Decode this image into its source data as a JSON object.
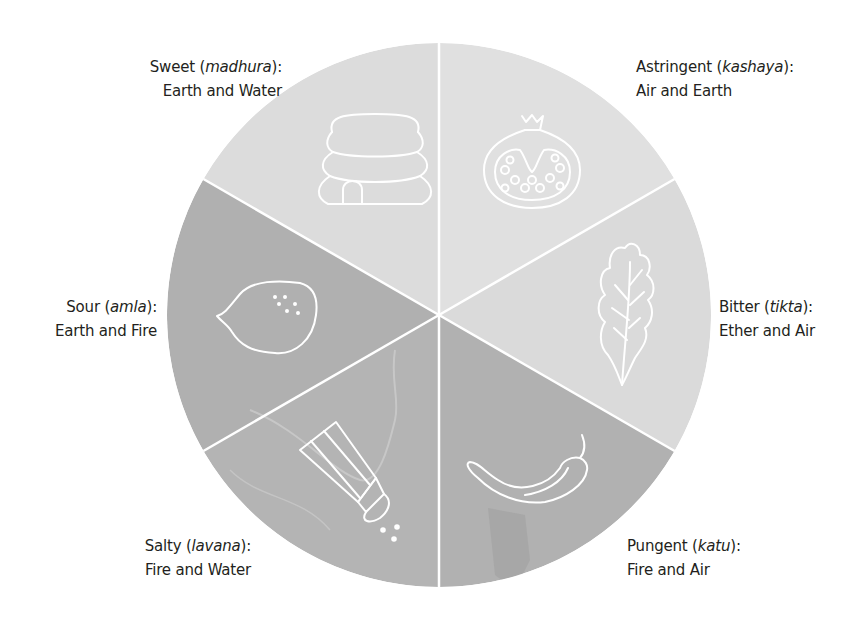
{
  "diagram": {
    "center": {
      "x": 439,
      "y": 315
    },
    "radius": 272,
    "colors": {
      "upper_segment": "#dedede",
      "lower_segment": "#b3b3b3",
      "divider": "#ffffff",
      "icon_stroke": "#ffffff",
      "text": "#231f20"
    },
    "segments": [
      {
        "id": "sweet",
        "taste": "Sweet",
        "sanskrit": "madhura",
        "elements": "Earth and Water",
        "icon": "beehive-icon",
        "shade": "light"
      },
      {
        "id": "astringent",
        "taste": "Astringent",
        "sanskrit": "kashaya",
        "elements": "Air and Earth",
        "icon": "pomegranate-icon",
        "shade": "light"
      },
      {
        "id": "bitter",
        "taste": "Bitter",
        "sanskrit": "tikta",
        "elements": "Ether and Air",
        "icon": "leaf-icon",
        "shade": "light"
      },
      {
        "id": "pungent",
        "taste": "Pungent",
        "sanskrit": "katu",
        "elements": "Fire and Air",
        "icon": "chili-pepper-icon",
        "shade": "dark"
      },
      {
        "id": "salty",
        "taste": "Salty",
        "sanskrit": "lavana",
        "elements": "Fire and Water",
        "icon": "salt-shaker-icon",
        "shade": "dark"
      },
      {
        "id": "sour",
        "taste": "Sour",
        "sanskrit": "amla",
        "elements": "Earth and Fire",
        "icon": "lemon-icon",
        "shade": "dark"
      }
    ],
    "punct": {
      "open": " (",
      "close": "):"
    }
  }
}
